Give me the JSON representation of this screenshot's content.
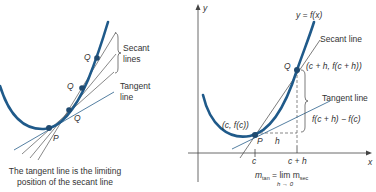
{
  "left_figure": {
    "labels": {
      "q_top": "Q",
      "q_mid": "Q",
      "q_low": "Q",
      "p": "P",
      "secant": "Secant",
      "secant2": "lines",
      "tangent": "Tangent",
      "tangent2": "line"
    },
    "caption_line1": "The tangent line is the limiting",
    "caption_line2": "position of the secant line"
  },
  "right_figure": {
    "y_axis": "y",
    "x_axis": "x",
    "function_label": "y = f(x)",
    "secant_label": "Secant line",
    "tangent_label": "Tangent line",
    "q_label": "Q",
    "q_coord": "(c + h, f(c + h))",
    "p_label": "P",
    "p_coord": "(c, f(c))",
    "h_label": "h",
    "rise_label": "f(c + h) − f(c)",
    "tick_c": "c",
    "tick_ch": "c + h",
    "formula_lhs": "m",
    "formula_lhs_sub": "tan",
    "formula_eq": " = lim m",
    "formula_rhs_sub": "sec",
    "formula_limit": "h → 0"
  },
  "colors": {
    "curve": "#1f5a8a",
    "line": "#444444"
  }
}
